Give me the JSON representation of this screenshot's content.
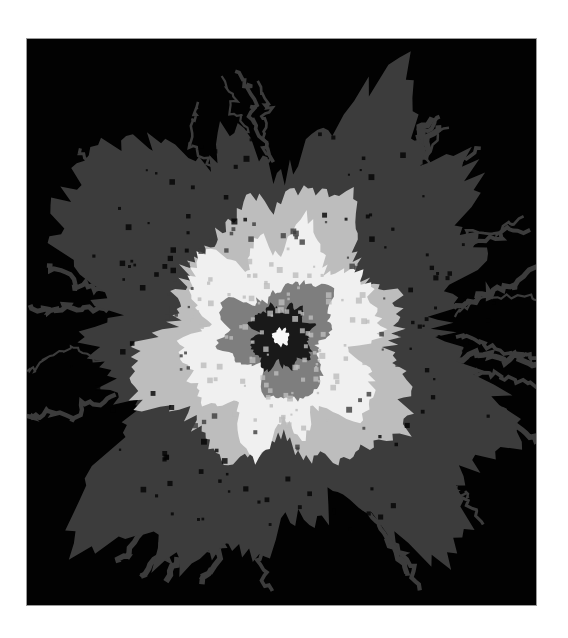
{
  "image": {
    "description": "Grayscale random-walk / aggregation cluster with concentric tone bands on black background",
    "frame": {
      "x": 26,
      "y": 38,
      "width": 511,
      "height": 568
    },
    "center": {
      "x": 280,
      "y": 336
    },
    "colors": {
      "background": "#020202",
      "outer_cluster": "#3c3c3c",
      "light_band": "#bdbdbd",
      "bright_band": "#f0f0f0",
      "mid_band": "#7e7e7e",
      "dark_core": "#191919",
      "center_dot": "#f7f7f7",
      "page": "#ffffff"
    },
    "bands": [
      {
        "name": "outer-cluster",
        "radius": 215
      },
      {
        "name": "light-band",
        "radius": 125
      },
      {
        "name": "bright-band",
        "radius": 95
      },
      {
        "name": "mid-band",
        "radius": 52
      },
      {
        "name": "dark-core",
        "radius": 30
      },
      {
        "name": "center-dot",
        "radius": 8
      }
    ]
  }
}
